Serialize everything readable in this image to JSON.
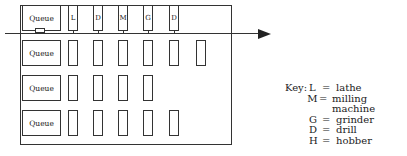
{
  "diagram": {
    "type": "cellular-manufacturing-layout",
    "flow_direction": "left-to-right",
    "rows": [
      {
        "queue_label": "Queue",
        "machines": [
          "L",
          "D",
          "M",
          "G",
          "D"
        ],
        "connected_to_flowline": true
      },
      {
        "queue_label": "Queue",
        "machines": [
          "",
          "",
          "",
          "",
          "",
          ""
        ]
      },
      {
        "queue_label": "Queue",
        "machines": [
          "",
          "",
          "",
          ""
        ]
      },
      {
        "queue_label": "Queue",
        "machines": [
          "",
          "",
          "",
          "",
          ""
        ]
      }
    ]
  },
  "key": {
    "title": "Key:",
    "entries": [
      {
        "symbol": "L",
        "eq": "=",
        "meaning": "lathe"
      },
      {
        "symbol": "M",
        "eq": "=",
        "meaning": "milling machine"
      },
      {
        "symbol": "G",
        "eq": "=",
        "meaning": "grinder"
      },
      {
        "symbol": "D",
        "eq": "=",
        "meaning": "drill"
      },
      {
        "symbol": "H",
        "eq": "=",
        "meaning": "hobber"
      }
    ]
  }
}
